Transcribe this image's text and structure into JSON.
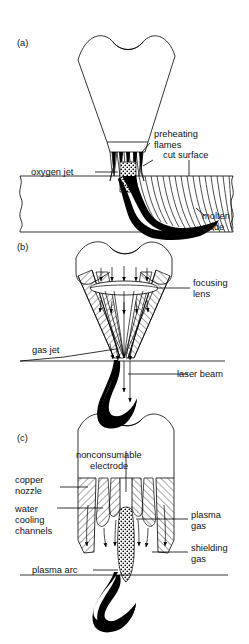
{
  "figure": {
    "background_color": "#ffffff",
    "line_color": "#000000",
    "panels": [
      {
        "id": "(a)",
        "name": "oxyfuel-cutting",
        "labels": [
          {
            "key": "preheating_flames",
            "text": "preheating",
            "text2": "flames"
          },
          {
            "key": "cut_surface",
            "text": "cut surface"
          },
          {
            "key": "oxygen_jet",
            "text": "oxygen jet"
          },
          {
            "key": "molten_oxide",
            "text": "molten",
            "text2": "oxide"
          }
        ]
      },
      {
        "id": "(b)",
        "name": "laser-cutting",
        "labels": [
          {
            "key": "focusing_lens",
            "text": "focusing",
            "text2": "lens"
          },
          {
            "key": "gas_jet",
            "text": "gas jet"
          },
          {
            "key": "laser_beam",
            "text": "laser beam"
          }
        ]
      },
      {
        "id": "(c)",
        "name": "plasma-arc-cutting",
        "labels": [
          {
            "key": "nonconsumable_electrode",
            "text": "nonconsumable",
            "text2": "electrode"
          },
          {
            "key": "copper_nozzle",
            "text": "copper",
            "text2": "nozzle"
          },
          {
            "key": "water_cooling_channels",
            "text": "water",
            "text2": "cooling",
            "text3": "channels"
          },
          {
            "key": "plasma_gas",
            "text": "plasma",
            "text2": "gas"
          },
          {
            "key": "shielding_gas",
            "text": "shielding",
            "text2": "gas"
          },
          {
            "key": "plasma_arc",
            "text": "plasma arc"
          }
        ]
      }
    ]
  },
  "panel_a": {
    "id": "(a)",
    "preheating_flames_l1": "preheating",
    "preheating_flames_l2": "flames",
    "cut_surface": "cut surface",
    "oxygen_jet": "oxygen jet",
    "molten_oxide_l1": "molten",
    "molten_oxide_l2": "oxide"
  },
  "panel_b": {
    "id": "(b)",
    "focusing_lens_l1": "focusing",
    "focusing_lens_l2": "lens",
    "gas_jet": "gas jet",
    "laser_beam": "laser beam"
  },
  "panel_c": {
    "id": "(c)",
    "electrode_l1": "nonconsumable",
    "electrode_l2": "electrode",
    "copper_nozzle_l1": "copper",
    "copper_nozzle_l2": "nozzle",
    "water_l1": "water",
    "water_l2": "cooling",
    "water_l3": "channels",
    "plasma_gas_l1": "plasma",
    "plasma_gas_l2": "gas",
    "shielding_gas_l1": "shielding",
    "shielding_gas_l2": "gas",
    "plasma_arc": "plasma arc"
  }
}
